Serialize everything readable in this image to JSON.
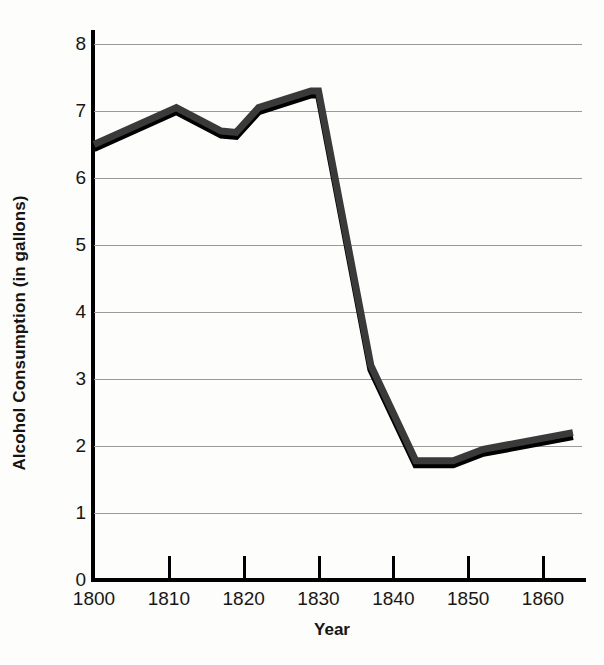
{
  "chart_data": {
    "type": "line",
    "title": "",
    "xlabel": "Year",
    "ylabel": "Alcohol Consumption (in gallons)",
    "xlim": [
      1800,
      1864
    ],
    "ylim": [
      0,
      8
    ],
    "xticks": [
      1800,
      1810,
      1820,
      1830,
      1840,
      1850,
      1860
    ],
    "xtick_labels": [
      "1800",
      "1810",
      "1820",
      "1830",
      "1840",
      "1850",
      "1860"
    ],
    "yticks": [
      0,
      1,
      2,
      3,
      4,
      5,
      6,
      7,
      8
    ],
    "ytick_labels": [
      "0",
      "1",
      "2",
      "3",
      "4",
      "5",
      "6",
      "7",
      "8"
    ],
    "grid": "horizontal",
    "legend": "none",
    "series": [
      {
        "name": "Alcohol Consumption",
        "line_color": "#3a3a3a",
        "shadow_color": "#000000",
        "x": [
          1800,
          1811,
          1817,
          1819,
          1822,
          1829,
          1830,
          1837,
          1843,
          1848,
          1852,
          1864
        ],
        "values": [
          6.5,
          7.05,
          6.7,
          6.68,
          7.05,
          7.3,
          7.3,
          3.2,
          1.78,
          1.78,
          1.95,
          2.2
        ]
      }
    ]
  },
  "axes": {
    "y_title": "Alcohol Consumption (in gallons)",
    "x_title": "Year"
  },
  "colors": {
    "background": "#fdfdfc",
    "axis": "#000000",
    "gridline": "#9a9a9a",
    "series_line": "#3a3a3a",
    "series_shadow": "#000000",
    "text": "#161616"
  }
}
